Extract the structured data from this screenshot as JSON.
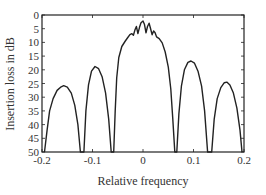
{
  "chart_data": {
    "type": "line",
    "title": "",
    "xlabel": "Relative frequency",
    "ylabel": "Insertion loss in dB",
    "xlim": [
      -0.2,
      0.2
    ],
    "ylim": [
      50,
      0
    ],
    "y_inverted": true,
    "grid": false,
    "legend": null,
    "x_ticks": [
      "-0.2",
      "-0.1",
      "0",
      "0.1",
      "0.2"
    ],
    "y_ticks": [
      "0",
      "5",
      "10",
      "15",
      "20",
      "25",
      "30",
      "35",
      "40",
      "45",
      "50"
    ],
    "series": [
      {
        "name": "Insertion loss",
        "color": "#222222",
        "points": [
          [
            -0.195,
            50
          ],
          [
            -0.19,
            42
          ],
          [
            -0.185,
            35
          ],
          [
            -0.178,
            30.5
          ],
          [
            -0.17,
            27.5
          ],
          [
            -0.162,
            26.2
          ],
          [
            -0.157,
            25.8
          ],
          [
            -0.15,
            26.3
          ],
          [
            -0.142,
            28.5
          ],
          [
            -0.135,
            33
          ],
          [
            -0.129,
            40
          ],
          [
            -0.124,
            50
          ],
          [
            -0.117,
            50
          ],
          [
            -0.113,
            35
          ],
          [
            -0.108,
            25.5
          ],
          [
            -0.102,
            20.5
          ],
          [
            -0.095,
            18.8
          ],
          [
            -0.088,
            19.6
          ],
          [
            -0.081,
            22.5
          ],
          [
            -0.074,
            28.5
          ],
          [
            -0.068,
            38
          ],
          [
            -0.063,
            50
          ],
          [
            -0.058,
            50
          ],
          [
            -0.055,
            35
          ],
          [
            -0.052,
            23
          ],
          [
            -0.048,
            15.5
          ],
          [
            -0.042,
            11.5
          ],
          [
            -0.035,
            9.5
          ],
          [
            -0.03,
            8.2
          ],
          [
            -0.026,
            7.2
          ],
          [
            -0.022,
            6.8
          ],
          [
            -0.019,
            7.4
          ],
          [
            -0.016,
            5.5
          ],
          [
            -0.013,
            4.2
          ],
          [
            -0.01,
            6.8
          ],
          [
            -0.007,
            4.5
          ],
          [
            -0.004,
            2.8
          ],
          [
            0.0,
            2.2
          ],
          [
            0.003,
            3.5
          ],
          [
            0.006,
            6.5
          ],
          [
            0.009,
            4.2
          ],
          [
            0.012,
            3.0
          ],
          [
            0.015,
            5.0
          ],
          [
            0.018,
            7.2
          ],
          [
            0.021,
            5.8
          ],
          [
            0.024,
            6.5
          ],
          [
            0.027,
            8.0
          ],
          [
            0.032,
            8.6
          ],
          [
            0.038,
            10.2
          ],
          [
            0.044,
            13.5
          ],
          [
            0.05,
            19
          ],
          [
            0.055,
            27
          ],
          [
            0.059,
            38
          ],
          [
            0.063,
            50
          ],
          [
            0.067,
            50
          ],
          [
            0.071,
            36
          ],
          [
            0.076,
            26
          ],
          [
            0.082,
            20
          ],
          [
            0.089,
            17.3
          ],
          [
            0.095,
            16.8
          ],
          [
            0.102,
            17.6
          ],
          [
            0.109,
            20.5
          ],
          [
            0.116,
            26
          ],
          [
            0.122,
            35
          ],
          [
            0.128,
            50
          ],
          [
            0.136,
            50
          ],
          [
            0.141,
            38
          ],
          [
            0.147,
            30.5
          ],
          [
            0.154,
            26.5
          ],
          [
            0.161,
            24.7
          ],
          [
            0.166,
            24.5
          ],
          [
            0.172,
            25.5
          ],
          [
            0.179,
            28.5
          ],
          [
            0.186,
            34
          ],
          [
            0.192,
            42
          ],
          [
            0.196,
            50
          ]
        ]
      }
    ]
  }
}
